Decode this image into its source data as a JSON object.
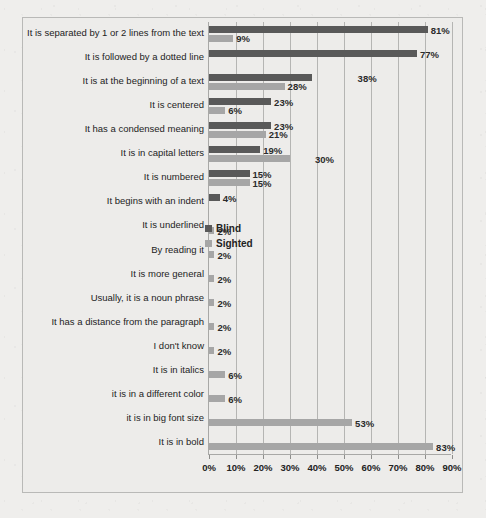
{
  "chart_data": {
    "type": "bar",
    "orientation": "horizontal",
    "title": "",
    "xlabel": "",
    "ylabel": "",
    "xlim": [
      0,
      90
    ],
    "xtick_labels": [
      "0%",
      "10%",
      "20%",
      "30%",
      "40%",
      "50%",
      "60%",
      "70%",
      "80%",
      "90%"
    ],
    "xticks": [
      0,
      10,
      20,
      30,
      40,
      50,
      60,
      70,
      80,
      90
    ],
    "grid": true,
    "legend_position": "inside-center-right",
    "categories": [
      "It is separated by 1 or 2 lines from the text",
      "It is followed by a dotted line",
      "It is at the beginning of a text",
      "It is centered",
      "It has a condensed meaning",
      "It is in capital letters",
      "It is numbered",
      "It begins with an indent",
      "It is underlined",
      "By reading it",
      "It is more general",
      "Usually, it is a noun phrase",
      "It has a distance from the paragraph",
      "I don't know",
      "It is in italics",
      "it is in a different color",
      "it is in big font size",
      "It is in bold"
    ],
    "series": [
      {
        "name": "Blind",
        "color": "#595959",
        "values": [
          81,
          77,
          38,
          23,
          23,
          19,
          15,
          4,
          null,
          null,
          null,
          null,
          null,
          null,
          null,
          null,
          null,
          null
        ],
        "labels": [
          "81%",
          "77%",
          "38%",
          "23%",
          "23%",
          "19%",
          "15%",
          "4%",
          "",
          "",
          "",
          "",
          "",
          "",
          "",
          "",
          "",
          ""
        ]
      },
      {
        "name": "Sighted",
        "color": "#a6a6a6",
        "values": [
          9,
          null,
          28,
          6,
          21,
          30,
          15,
          null,
          2,
          2,
          2,
          2,
          2,
          2,
          6,
          6,
          53,
          83
        ],
        "labels": [
          "9%",
          "",
          "28%",
          "6%",
          "21%",
          "30%",
          "15%",
          "",
          "2%",
          "2%",
          "2%",
          "2%",
          "2%",
          "2%",
          "6%",
          "6%",
          "53%",
          "83%"
        ]
      }
    ]
  },
  "legend": {
    "entries": [
      {
        "label": "Blind",
        "color": "#595959"
      },
      {
        "label": "Sighted",
        "color": "#a6a6a6"
      }
    ]
  }
}
